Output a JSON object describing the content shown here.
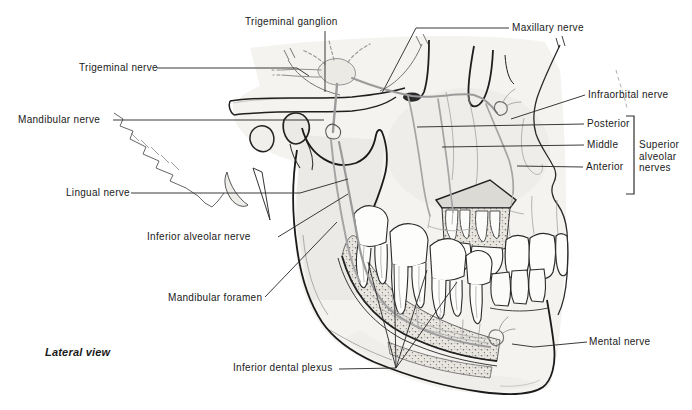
{
  "figure": {
    "view_caption": "Lateral view",
    "labels": {
      "trigeminal_ganglion": "Trigeminal ganglion",
      "maxillary_nerve": "Maxillary nerve",
      "trigeminal_nerve": "Trigeminal nerve",
      "infraorbital_nerve": "Infraorbital nerve",
      "mandibular_nerve": "Mandibular nerve",
      "posterior": "Posterior",
      "middle": "Middle",
      "anterior": "Anterior",
      "superior_alveolar_nerves": "Superior alveolar nerves",
      "lingual_nerve": "Lingual nerve",
      "inferior_alveolar_nerve": "Inferior alveolar nerve",
      "mandibular_foramen": "Mandibular foramen",
      "inferior_dental_plexus": "Inferior dental plexus",
      "mental_nerve": "Mental nerve"
    },
    "colors": {
      "ink": "#1f1f1f",
      "nerve_gray": "#9b9b9b",
      "paper": "#ffffff",
      "label_text": "#1a1a1a"
    }
  }
}
